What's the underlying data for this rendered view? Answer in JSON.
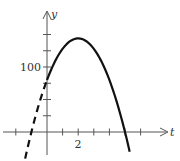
{
  "chart_data": {
    "type": "line",
    "title": "",
    "xlabel": "t",
    "ylabel": "y",
    "x_tick_labels": [
      {
        "value": 2,
        "label": "2"
      }
    ],
    "y_tick_labels": [
      {
        "value": 100,
        "label": "100"
      }
    ],
    "x_ticks": [
      -2,
      1,
      2,
      3,
      4,
      5,
      6
    ],
    "y_ticks": [
      25,
      50,
      75,
      100,
      125,
      150
    ],
    "xlim": [
      -3,
      8
    ],
    "ylim": [
      -30,
      180
    ],
    "grid": false,
    "legend": null,
    "series": [
      {
        "name": "y = -16t^2 + 64t + 80 (solid, t >= 0)",
        "style": "solid",
        "x": [
          0,
          0.5,
          1,
          1.5,
          2,
          2.5,
          3,
          3.5,
          4,
          4.5,
          5,
          5.3
        ],
        "y": [
          80,
          108,
          128,
          140,
          144,
          140,
          128,
          108,
          80,
          44,
          0,
          -29.4
        ]
      },
      {
        "name": "y = -16t^2 + 64t + 80 (dashed, t < 0)",
        "style": "dashed",
        "x": [
          -1.4,
          -1.2,
          -1,
          -0.8,
          -0.6,
          -0.4,
          -0.2,
          0
        ],
        "y": [
          -41.0,
          -19.8,
          0,
          18.5,
          35.8,
          51.8,
          66.6,
          80
        ]
      }
    ]
  },
  "labels": {
    "x_axis": "t",
    "y_axis": "y",
    "x_tick_2": "2",
    "y_tick_100": "100"
  },
  "colors": {
    "axis": "#555555",
    "curve": "#111111"
  }
}
